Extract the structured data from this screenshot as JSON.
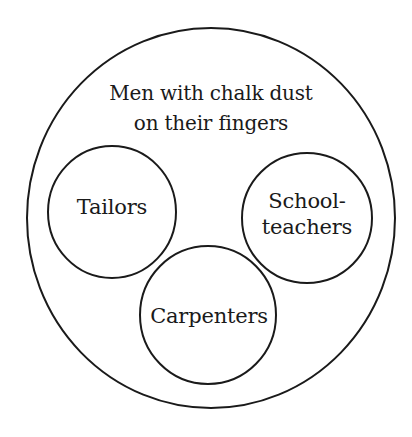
{
  "diagram": {
    "type": "euler-diagram",
    "stroke_color": "#1a1a1a",
    "background_color": "#ffffff",
    "outer_set": {
      "label_lines": [
        "Men with chalk dust",
        "on their fingers"
      ],
      "shape": {
        "cx": 211,
        "cy": 218,
        "rx": 184,
        "ry": 190
      }
    },
    "inner_sets": [
      {
        "id": "tailors",
        "label_lines": [
          "Tailors"
        ],
        "shape": {
          "cx": 112,
          "cy": 212,
          "rx": 64,
          "ry": 66
        }
      },
      {
        "id": "schoolteachers",
        "label_lines": [
          "School-",
          "teachers"
        ],
        "shape": {
          "cx": 307,
          "cy": 218,
          "rx": 65,
          "ry": 65
        }
      },
      {
        "id": "carpenters",
        "label_lines": [
          "Carpenters"
        ],
        "shape": {
          "cx": 208,
          "cy": 315,
          "rx": 68,
          "ry": 69
        }
      }
    ]
  }
}
